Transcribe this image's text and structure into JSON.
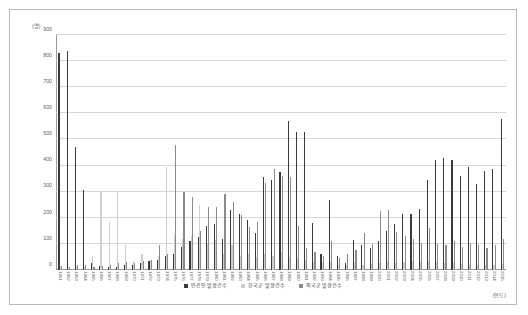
{
  "chart_data": {
    "type": "bar",
    "title": "",
    "xlabel": "(연도)",
    "ylabel": "(명)",
    "ylim": [
      0,
      900
    ],
    "yticks": [
      0,
      100,
      200,
      300,
      400,
      500,
      600,
      700,
      800,
      900
    ],
    "grid": true,
    "legend_position": "bottom",
    "categories": [
      "1961",
      "1962",
      "1963",
      "1964",
      "1965",
      "1966",
      "1967",
      "1968",
      "1969",
      "1970",
      "1971",
      "1972",
      "1973",
      "1974",
      "1975",
      "1976",
      "1977",
      "1978",
      "1979",
      "1980",
      "1981",
      "1982",
      "1983",
      "1984",
      "1985",
      "1986",
      "1987",
      "1988",
      "1989",
      "1990",
      "1991",
      "1992",
      "1993",
      "1994",
      "1995",
      "1996",
      "1997",
      "1998",
      "1999",
      "2000",
      "2001",
      "2002",
      "2003",
      "2004",
      "2005",
      "2006",
      "2007",
      "2008",
      "2009",
      "2010",
      "2011",
      "2012",
      "2013",
      "2014",
      "2015"
    ],
    "series": [
      {
        "name": "민간인 발생건수",
        "color": "#3a3a3a",
        "values": [
          830,
          840,
          470,
          305,
          25,
          15,
          10,
          12,
          18,
          20,
          25,
          35,
          40,
          55,
          60,
          90,
          110,
          125,
          170,
          175,
          120,
          230,
          215,
          190,
          140,
          355,
          345,
          375,
          570,
          530,
          530,
          180,
          60,
          270,
          55,
          25,
          115,
          95,
          85,
          110,
          150,
          175,
          215,
          215,
          235,
          345,
          420,
          430,
          420,
          360,
          395,
          330,
          380,
          385,
          580
        ]
      },
      {
        "name": "한국군 발생건수",
        "color": "#cfcfcf",
        "values": [
          10,
          8,
          12,
          10,
          55,
          300,
          185,
          300,
          95,
          35,
          60,
          40,
          55,
          395,
          135,
          120,
          130,
          250,
          100,
          115,
          60,
          95,
          55,
          60,
          50,
          60,
          55,
          70,
          50,
          45,
          40,
          30,
          25,
          30,
          20,
          18,
          25,
          20,
          22,
          25,
          30,
          28,
          30,
          35,
          32,
          35,
          30,
          28,
          25,
          22,
          20,
          18,
          20,
          18,
          22
        ]
      },
      {
        "name": "외국군 발생건수",
        "color": "#8a8a8a",
        "values": [
          15,
          12,
          20,
          18,
          12,
          15,
          20,
          25,
          30,
          28,
          35,
          38,
          95,
          60,
          480,
          300,
          280,
          150,
          240,
          240,
          290,
          260,
          210,
          165,
          185,
          335,
          385,
          360,
          355,
          170,
          85,
          70,
          55,
          110,
          45,
          60,
          75,
          140,
          100,
          225,
          230,
          145,
          130,
          120,
          105,
          160,
          100,
          95,
          110,
          90,
          105,
          95,
          85,
          95,
          120
        ]
      }
    ]
  }
}
